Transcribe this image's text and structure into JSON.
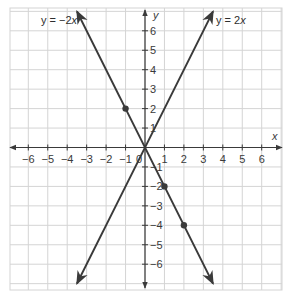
{
  "chart_data": {
    "type": "line",
    "title": "",
    "xlabel": "x",
    "ylabel": "y",
    "xlim": [
      -6,
      6
    ],
    "ylim": [
      -6,
      6
    ],
    "grid": true,
    "x_ticks": [
      -6,
      -5,
      -4,
      -3,
      -2,
      -1,
      0,
      1,
      2,
      3,
      4,
      5,
      6
    ],
    "y_ticks": [
      -6,
      -5,
      -4,
      -3,
      -2,
      -1,
      1,
      2,
      3,
      4,
      5,
      6
    ],
    "x_tick_labels": [
      "−6",
      "−5",
      "−4",
      "−3",
      "−2",
      "−1",
      "0",
      "1",
      "2",
      "3",
      "4",
      "5",
      "6"
    ],
    "y_tick_labels": [
      "−6",
      "−5",
      "−4",
      "−3",
      "−2",
      "−1",
      "1",
      "2",
      "3",
      "4",
      "5",
      "6"
    ],
    "series": [
      {
        "name": "y = −2x",
        "label": "y = −2x",
        "slope": -2,
        "intercept": 0,
        "x_range": [
          -3.5,
          3.5
        ],
        "points": [
          [
            -1,
            2
          ],
          [
            0,
            0
          ],
          [
            1,
            -2
          ],
          [
            2,
            -4
          ]
        ],
        "color": "#3a3a3a"
      },
      {
        "name": "y = 2x",
        "label": "y = 2x",
        "slope": 2,
        "intercept": 0,
        "x_range": [
          -3.5,
          3.5
        ],
        "points": [],
        "color": "#3a3a3a"
      }
    ]
  },
  "labels": {
    "x_axis": "x",
    "y_axis": "y",
    "eq_neg_pre": "y = −2",
    "eq_neg_var": "x",
    "eq_pos_pre": "y = 2",
    "eq_pos_var": "x",
    "origin": "0"
  },
  "colors": {
    "grid": "#d4d4d4",
    "axis": "#3a3a3a",
    "line": "#3a3a3a",
    "text": "#3a3a3a"
  }
}
